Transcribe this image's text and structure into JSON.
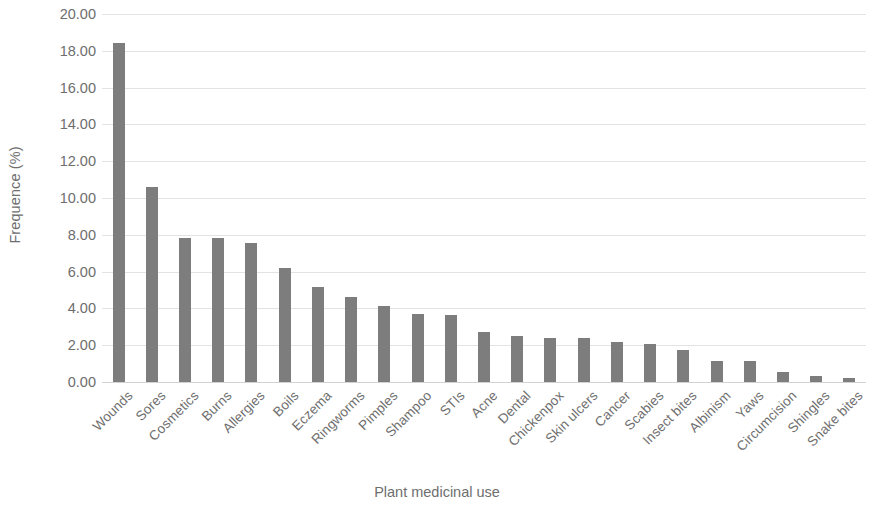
{
  "chart_data": {
    "type": "bar",
    "title": "",
    "subtitle": "",
    "xlabel": "Plant medicinal use",
    "ylabel": "Frequence (%)",
    "ylim": [
      0,
      20
    ],
    "ytick_step": 2,
    "ytick_labels": [
      "20.00",
      "18.00",
      "16.00",
      "14.00",
      "12.00",
      "10.00",
      "8.00",
      "6.00",
      "4.00",
      "2.00",
      "0.00"
    ],
    "ytick_values": [
      20,
      18,
      16,
      14,
      12,
      10,
      8,
      6,
      4,
      2,
      0
    ],
    "grid": true,
    "grid_axis": "y",
    "legend": false,
    "legend_position": "none",
    "bar_color": "#7d7d7d",
    "grid_color": "#e3e3e3",
    "text_color": "#6e6e6e",
    "categories": [
      "Wounds",
      "Sores",
      "Cosmetics",
      "Burns",
      "Allergies",
      "Boils",
      "Eczema",
      "Ringworms",
      "Pimples",
      "Shampoo",
      "STIs",
      "Acne",
      "Dental",
      "Chickenpox",
      "Skin ulcers",
      "Cancer",
      "Scabies",
      "Insect bites",
      "Albinism",
      "Yaws",
      "Circumcision",
      "Shingles",
      "Snake bites"
    ],
    "values": [
      18.4,
      10.6,
      7.85,
      7.85,
      7.55,
      6.2,
      5.15,
      4.6,
      4.15,
      3.7,
      3.65,
      2.7,
      2.5,
      2.4,
      2.4,
      2.2,
      2.05,
      1.75,
      1.15,
      1.15,
      0.55,
      0.35,
      0.2
    ]
  }
}
